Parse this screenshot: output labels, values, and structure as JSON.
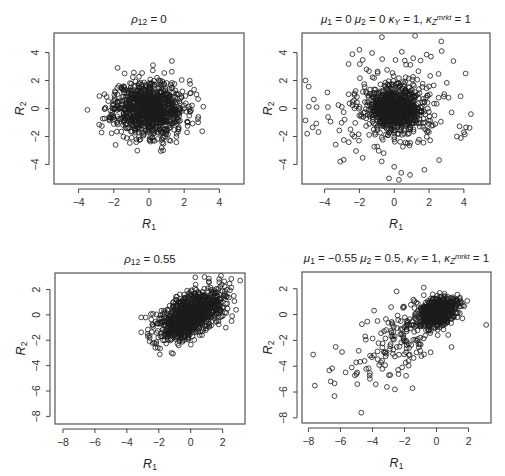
{
  "chart_data": [
    {
      "type": "scatter",
      "panel": "top-left",
      "title": "ρ12 = 0",
      "title_parts": [
        {
          "t": "ρ",
          "it": true
        },
        {
          "t": "12",
          "sub": true
        },
        {
          "t": " = 0"
        }
      ],
      "xlabel": "R1",
      "ylabel": "R2",
      "xlim": [
        -5.4,
        5.4
      ],
      "ylim": [
        -5.4,
        5.4
      ],
      "xticks": [
        -4,
        -2,
        0,
        2,
        4
      ],
      "yticks": [
        -4,
        -2,
        0,
        2,
        4
      ],
      "frame_px": {
        "left": 54,
        "top": 33,
        "right": 244,
        "bottom": 184
      },
      "grid": false,
      "marker": "open-circle",
      "generator": {
        "n": 1000,
        "mu": [
          0,
          0
        ],
        "sd": [
          1,
          1
        ],
        "rho": 0,
        "seed": 11,
        "tail": "normal",
        "clip": [
          -3.6,
          3.6
        ]
      },
      "notable_points": [
        [
          -3.5,
          -0.1
        ],
        [
          1.3,
          3.4
        ],
        [
          0.8,
          -3.0
        ],
        [
          2.7,
          1.0
        ],
        [
          2.8,
          -0.6
        ],
        [
          -1.9,
          -2.6
        ]
      ]
    },
    {
      "type": "scatter",
      "panel": "top-right",
      "title": "μ1 = 0 μ2 = 0 κY = 1, κZmrkt = 1",
      "title_parts": [
        {
          "t": "μ",
          "it": true
        },
        {
          "t": "1",
          "sub": true
        },
        {
          "t": " = 0 "
        },
        {
          "t": "μ",
          "it": true
        },
        {
          "t": "2",
          "sub": true
        },
        {
          "t": " = 0 "
        },
        {
          "t": "κ",
          "it": true
        },
        {
          "t": "Y",
          "sub": true,
          "it": true
        },
        {
          "t": " = 1, "
        },
        {
          "t": "κ",
          "it": true
        },
        {
          "t": "Z",
          "sub": true,
          "it": true
        },
        {
          "t": "mrkt",
          "sup": true,
          "it": true
        },
        {
          "t": " = 1"
        }
      ],
      "xlabel": "R1",
      "ylabel": "R2",
      "xlim": [
        -5.3,
        5.5
      ],
      "ylim": [
        -5.4,
        5.4
      ],
      "xticks": [
        -4,
        -2,
        0,
        2,
        4
      ],
      "yticks": [
        -4,
        -2,
        0,
        2,
        4
      ],
      "frame_px": {
        "left": 302,
        "top": 33,
        "right": 490,
        "bottom": 184
      },
      "grid": false,
      "marker": "open-circle",
      "generator": {
        "n": 1000,
        "mu": [
          0,
          0
        ],
        "sd": [
          0.75,
          0.75
        ],
        "rho": 0,
        "seed": 23,
        "tail": "heavy",
        "tail_frac": 0.22,
        "tail_sd": 2.0,
        "clip": [
          -5.2,
          5.2
        ]
      },
      "notable_points": [
        [
          -5.1,
          2.0
        ],
        [
          -5.1,
          -0.85
        ],
        [
          -5.0,
          -1.8
        ],
        [
          1.2,
          5.2
        ],
        [
          2.7,
          4.8
        ],
        [
          4.1,
          2.5
        ],
        [
          4.4,
          -0.4
        ],
        [
          3.4,
          3.4
        ],
        [
          -2.0,
          4.2
        ],
        [
          -0.3,
          -5.0
        ],
        [
          0.4,
          -4.6
        ],
        [
          -3.1,
          -3.8
        ],
        [
          3.6,
          -2.0
        ],
        [
          4.0,
          -1.7
        ]
      ]
    },
    {
      "type": "scatter",
      "panel": "bottom-left",
      "title": "ρ12 = 0.55",
      "title_parts": [
        {
          "t": "ρ",
          "it": true
        },
        {
          "t": "12",
          "sub": true
        },
        {
          "t": " = 0.55"
        }
      ],
      "xlabel": "R1",
      "ylabel": "R2",
      "xlim": [
        -8.5,
        3.4
      ],
      "ylim": [
        -8.6,
        3.3
      ],
      "xticks": [
        -8,
        -6,
        -4,
        -2,
        0,
        2
      ],
      "yticks": [
        -8,
        -6,
        -4,
        -2,
        0,
        2
      ],
      "frame_px": {
        "left": 55,
        "top": 273,
        "right": 245,
        "bottom": 424
      },
      "grid": false,
      "marker": "open-circle",
      "generator": {
        "n": 1000,
        "mu": [
          0,
          0
        ],
        "sd": [
          1,
          1
        ],
        "rho": 0.55,
        "seed": 37,
        "tail": "normal",
        "clip": [
          -3.2,
          3.2
        ]
      },
      "notable_points": [
        [
          -3.1,
          -0.2
        ],
        [
          3.1,
          2.7
        ],
        [
          -1.2,
          -3.0
        ],
        [
          2.6,
          -0.1
        ],
        [
          2.2,
          -1.0
        ],
        [
          -2.7,
          -1.5
        ]
      ]
    },
    {
      "type": "scatter",
      "panel": "bottom-right",
      "title": "μ1 = −0.55 μ2 = 0.5, κY = 1, κZmrkt = 1",
      "title_parts": [
        {
          "t": "μ",
          "it": true
        },
        {
          "t": "1",
          "sub": true
        },
        {
          "t": " = −0.55 "
        },
        {
          "t": "μ",
          "it": true
        },
        {
          "t": "2",
          "sub": true
        },
        {
          "t": " = 0.5, "
        },
        {
          "t": "κ",
          "it": true
        },
        {
          "t": "Y",
          "sub": true,
          "it": true
        },
        {
          "t": " = 1, "
        },
        {
          "t": "κ",
          "it": true
        },
        {
          "t": "Z",
          "sub": true,
          "it": true
        },
        {
          "t": "mrkt",
          "sup": true,
          "it": true
        },
        {
          "t": " = 1"
        }
      ],
      "xlabel": "R1",
      "ylabel": "R2",
      "xlim": [
        -8.4,
        3.4
      ],
      "ylim": [
        -8.4,
        3.3
      ],
      "xticks": [
        -8,
        -6,
        -4,
        -2,
        0,
        2
      ],
      "yticks": [
        -8,
        -6,
        -4,
        -2,
        0,
        2
      ],
      "frame_px": {
        "left": 302,
        "top": 272,
        "right": 491,
        "bottom": 423
      },
      "grid": false,
      "marker": "open-circle",
      "generator": {
        "n": 800,
        "mu": [
          0.1,
          0.2
        ],
        "sd": [
          0.6,
          0.55
        ],
        "rho": 0.3,
        "seed": 53,
        "tail": "skew-lower-left",
        "tail_frac": 0.2,
        "clip": [
          -8,
          3.2
        ]
      },
      "notable_points": [
        [
          -7.7,
          -3.1
        ],
        [
          -7.6,
          -5.5
        ],
        [
          -4.7,
          -7.6
        ],
        [
          -6.3,
          -2.5
        ],
        [
          -5.9,
          -2.9
        ],
        [
          -5.3,
          -4.1
        ],
        [
          -5.0,
          -4.6
        ],
        [
          3.1,
          -0.8
        ],
        [
          -0.8,
          2.1
        ],
        [
          -3.8,
          -5.4
        ],
        [
          -2.6,
          -5.8
        ],
        [
          -1.5,
          -5.7
        ],
        [
          -3.1,
          -5.6
        ]
      ]
    }
  ]
}
